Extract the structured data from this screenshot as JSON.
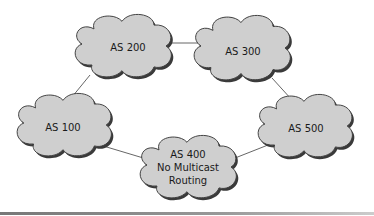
{
  "diagram": {
    "type": "network-topology",
    "nodes": [
      {
        "id": "as200",
        "lines": [
          "AS 200"
        ]
      },
      {
        "id": "as300",
        "lines": [
          "AS 300"
        ]
      },
      {
        "id": "as100",
        "lines": [
          "AS 100"
        ]
      },
      {
        "id": "as500",
        "lines": [
          "AS 500"
        ]
      },
      {
        "id": "as400",
        "lines": [
          "AS 400",
          "No Multicast",
          "Routing"
        ]
      }
    ],
    "edges": [
      [
        "as200",
        "as300"
      ],
      [
        "as200",
        "as100"
      ],
      [
        "as300",
        "as500"
      ],
      [
        "as100",
        "as400"
      ],
      [
        "as400",
        "as500"
      ]
    ],
    "colors": {
      "cloud_fill": "#cfcfcf",
      "cloud_outline": "#3f3f3f",
      "link": "#555555"
    }
  }
}
